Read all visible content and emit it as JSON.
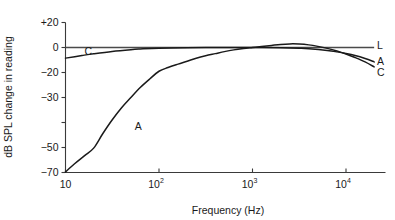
{
  "chart_data": {
    "type": "line",
    "title": "",
    "xlabel": "Frequency (Hz)",
    "ylabel": "dB SPL change in reading",
    "xscale": "log",
    "xlim": [
      10,
      20000
    ],
    "ylim": [
      -70,
      20
    ],
    "grid": false,
    "legend_position": "right-inline",
    "x_tick_labels": [
      "10",
      "10²",
      "10³",
      "10⁴"
    ],
    "x_tick_bases": [
      "10",
      "10",
      "10",
      "10"
    ],
    "x_tick_exponents": [
      "",
      "2",
      "3",
      "4"
    ],
    "x_tick_values": [
      10,
      100,
      1000,
      10000
    ],
    "y_tick_labels": [
      "+20",
      "0",
      "−20",
      "−30",
      "",
      "−50",
      "−70"
    ],
    "y_tick_values": [
      20,
      0,
      -20,
      -30,
      -40,
      -50,
      -70
    ],
    "series": [
      {
        "name": "L",
        "label": "L",
        "label_position": "right",
        "description": "Linear weighting, flat at 0 dB across the band",
        "points": [
          [
            10,
            0
          ],
          [
            20,
            0
          ],
          [
            50,
            0
          ],
          [
            100,
            0
          ],
          [
            200,
            0
          ],
          [
            500,
            0
          ],
          [
            1000,
            0
          ],
          [
            2000,
            0
          ],
          [
            5000,
            0
          ],
          [
            10000,
            0
          ],
          [
            20000,
            0
          ]
        ]
      },
      {
        "name": "C",
        "label": "C",
        "label_position": "both",
        "description": "C weighting, −8 dB at 10 Hz rising to 0 dB mid-band then falling at high frequency",
        "points": [
          [
            10,
            -8.5
          ],
          [
            15,
            -6.4
          ],
          [
            20,
            -5.0
          ],
          [
            31.5,
            -3.1
          ],
          [
            50,
            -1.7
          ],
          [
            63,
            -1.2
          ],
          [
            100,
            -0.5
          ],
          [
            200,
            -0.1
          ],
          [
            500,
            0.0
          ],
          [
            1000,
            0.0
          ],
          [
            2000,
            -0.2
          ],
          [
            3150,
            -0.6
          ],
          [
            4000,
            -1.0
          ],
          [
            6300,
            -2.4
          ],
          [
            8000,
            -3.5
          ],
          [
            10000,
            -4.8
          ],
          [
            12500,
            -6.4
          ],
          [
            16000,
            -8.8
          ],
          [
            20000,
            -11.5
          ]
        ]
      },
      {
        "name": "A",
        "label": "A",
        "label_position": "both",
        "description": "A weighting, −70 dB at 10 Hz rising through 0 dB near 1 kHz, peaking about +3 dB near 2.5 kHz then falling",
        "points": [
          [
            10,
            -69.5
          ],
          [
            12.5,
            -63.0
          ],
          [
            16,
            -56.5
          ],
          [
            20,
            -50.5
          ],
          [
            25,
            -44.5
          ],
          [
            31.5,
            -39.0
          ],
          [
            40,
            -34.0
          ],
          [
            50,
            -30.0
          ],
          [
            63,
            -26.0
          ],
          [
            80,
            -22.5
          ],
          [
            100,
            -19.0
          ],
          [
            125,
            -16.0
          ],
          [
            160,
            -13.3
          ],
          [
            200,
            -11.0
          ],
          [
            250,
            -8.6
          ],
          [
            315,
            -6.6
          ],
          [
            400,
            -4.9
          ],
          [
            500,
            -3.3
          ],
          [
            630,
            -1.9
          ],
          [
            800,
            -0.8
          ],
          [
            1000,
            0.0
          ],
          [
            1250,
            0.8
          ],
          [
            1600,
            1.7
          ],
          [
            2000,
            2.5
          ],
          [
            2500,
            2.9
          ],
          [
            3150,
            2.8
          ],
          [
            4000,
            2.1
          ],
          [
            5000,
            0.9
          ],
          [
            6300,
            -0.7
          ],
          [
            8000,
            -2.8
          ],
          [
            10000,
            -5.2
          ],
          [
            12500,
            -8.0
          ],
          [
            16000,
            -11.5
          ],
          [
            20000,
            -15.5
          ]
        ]
      }
    ],
    "annotations": [
      {
        "text": "C",
        "x": 16,
        "y": -3.0,
        "name": "curve-label-c-left"
      },
      {
        "text": "A",
        "x": 55,
        "y": -41.5,
        "name": "curve-label-a-left"
      },
      {
        "text": "L",
        "x": 21500,
        "y": 1.5,
        "name": "curve-label-l-right"
      },
      {
        "text": "A",
        "x": 21500,
        "y": -11.0,
        "name": "curve-label-a-right"
      },
      {
        "text": "C",
        "x": 21500,
        "y": -20.0,
        "name": "curve-label-c-right"
      }
    ]
  },
  "colors": {
    "background": "#ffffff",
    "axis": "#3a3a3a",
    "curve": "#1a1a1a",
    "zero_line": "#4a4a4a",
    "text": "#1a1a1a"
  }
}
